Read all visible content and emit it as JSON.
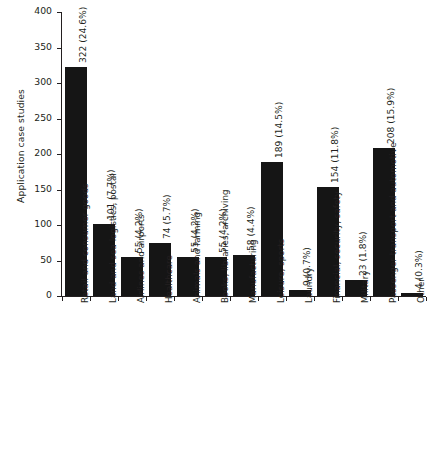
{
  "chart_data": {
    "type": "bar",
    "title": "",
    "xlabel": "",
    "ylabel": "Application case studies",
    "ylim": [
      0,
      400
    ],
    "yticks": [
      0,
      50,
      100,
      150,
      200,
      250,
      300,
      350,
      400
    ],
    "grid": false,
    "legend": null,
    "bar_color": "#151515",
    "background_color": "#ffffff",
    "axis_color": "#231f20",
    "categories": [
      "Retail and consumer goods",
      "Land and sea logistics, postal",
      "Airlines and airports",
      "Healthcare",
      "Animals and farming",
      "Books, libraries, archiving",
      "Manufacturing",
      "Leisure, sports",
      "Laundry",
      "Financial, security, safety",
      "Military",
      "Passenger transport and automotive",
      "Other"
    ],
    "values": [
      322,
      101,
      55,
      74,
      55,
      55,
      58,
      189,
      9,
      154,
      23,
      208,
      4
    ],
    "percentages": [
      "24.6%",
      "7.7%",
      "4.2%",
      "5.7%",
      "4.2%",
      "4.2%",
      "4.4%",
      "14.5%",
      "0.7%",
      "11.8%",
      "1.8%",
      "15.9%",
      "0.3%"
    ],
    "data_labels": [
      "322 (24.6%)",
      "101 (7.7%)",
      "55 (4.2%)",
      "74 (5.7%)",
      "55 (4.2%)",
      "55 (4.2%)",
      "58 (4.4%)",
      "189 (14.5%)",
      "9 (0.7%)",
      "154 (11.8%)",
      "23 (1.8%)",
      "208 (15.9%)",
      "4 (0.3%)"
    ]
  }
}
